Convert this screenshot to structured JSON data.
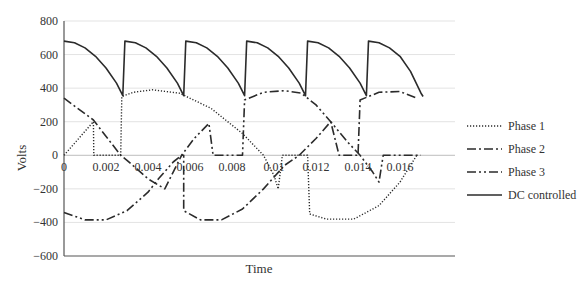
{
  "chart_data": {
    "type": "line",
    "title": "",
    "xlabel": "Time",
    "ylabel": "Volts",
    "xlim": [
      0,
      0.0185
    ],
    "ylim": [
      -600,
      800
    ],
    "x_ticks": [
      "0",
      "0.002",
      "0.004",
      "0.006",
      "0.008",
      "0.01",
      "0.012",
      "0.014",
      "0.016"
    ],
    "x_tick_values": [
      0,
      0.002,
      0.004,
      0.006,
      0.008,
      0.01,
      0.012,
      0.014,
      0.016
    ],
    "y_ticks": [
      "800",
      "600",
      "400",
      "200",
      "0",
      "−200",
      "−400",
      "−600"
    ],
    "y_tick_values": [
      800,
      600,
      400,
      200,
      0,
      -200,
      -400,
      -600
    ],
    "grid": true,
    "legend_position": "right",
    "series": [
      {
        "name": "Phase 1",
        "style": "dotted",
        "points": [
          [
            0,
            0
          ],
          [
            0.0014,
            200
          ],
          [
            0.00142,
            0
          ],
          [
            0.0027,
            0
          ],
          [
            0.00275,
            350
          ],
          [
            0.0033,
            375
          ],
          [
            0.0042,
            390
          ],
          [
            0.0055,
            370
          ],
          [
            0.007,
            280
          ],
          [
            0.0085,
            130
          ],
          [
            0.0095,
            0
          ],
          [
            0.01,
            -120
          ],
          [
            0.0102,
            -200
          ],
          [
            0.0104,
            0
          ],
          [
            0.0116,
            0
          ],
          [
            0.0117,
            -350
          ],
          [
            0.0125,
            -380
          ],
          [
            0.0138,
            -380
          ],
          [
            0.015,
            -300
          ],
          [
            0.016,
            -160
          ],
          [
            0.0168,
            0
          ]
        ]
      },
      {
        "name": "Phase 2",
        "style": "dash-dot",
        "points": [
          [
            0,
            340
          ],
          [
            0.0014,
            210
          ],
          [
            0.0027,
            0
          ],
          [
            0.003,
            -30
          ],
          [
            0.004,
            -140
          ],
          [
            0.0048,
            -200
          ],
          [
            0.0052,
            -100
          ],
          [
            0.0056,
            0
          ],
          [
            0.0057,
            0
          ],
          [
            0.0057,
            -330
          ],
          [
            0.0065,
            -385
          ],
          [
            0.0075,
            -385
          ],
          [
            0.0085,
            -320
          ],
          [
            0.0095,
            -200
          ],
          [
            0.0105,
            -60
          ],
          [
            0.0112,
            0
          ],
          [
            0.012,
            100
          ],
          [
            0.0127,
            200
          ],
          [
            0.0131,
            0
          ],
          [
            0.0138,
            0
          ],
          [
            0.014,
            0
          ],
          [
            0.0141,
            330
          ],
          [
            0.015,
            375
          ],
          [
            0.016,
            380
          ],
          [
            0.0168,
            340
          ]
        ]
      },
      {
        "name": "Phase 3",
        "style": "dash-dot-dot",
        "points": [
          [
            0,
            -340
          ],
          [
            0.001,
            -385
          ],
          [
            0.002,
            -385
          ],
          [
            0.003,
            -330
          ],
          [
            0.004,
            -220
          ],
          [
            0.0045,
            -140
          ],
          [
            0.0052,
            -40
          ],
          [
            0.0056,
            0
          ],
          [
            0.0062,
            100
          ],
          [
            0.0069,
            190
          ],
          [
            0.0071,
            0
          ],
          [
            0.0083,
            0
          ],
          [
            0.0085,
            0
          ],
          [
            0.0086,
            330
          ],
          [
            0.0095,
            375
          ],
          [
            0.0105,
            385
          ],
          [
            0.0113,
            370
          ],
          [
            0.012,
            300
          ],
          [
            0.0127,
            200
          ],
          [
            0.0135,
            80
          ],
          [
            0.0141,
            0
          ],
          [
            0.0147,
            -100
          ],
          [
            0.015,
            -160
          ],
          [
            0.0152,
            0
          ],
          [
            0.0163,
            0
          ],
          [
            0.017,
            0
          ]
        ]
      },
      {
        "name": "DC controlled",
        "style": "solid",
        "points": [
          [
            0,
            680
          ],
          [
            0.0005,
            670
          ],
          [
            0.001,
            640
          ],
          [
            0.0015,
            590
          ],
          [
            0.002,
            520
          ],
          [
            0.0025,
            430
          ],
          [
            0.0028,
            355
          ],
          [
            0.0029,
            680
          ],
          [
            0.0034,
            670
          ],
          [
            0.0039,
            640
          ],
          [
            0.0044,
            590
          ],
          [
            0.0049,
            520
          ],
          [
            0.0054,
            430
          ],
          [
            0.0057,
            355
          ],
          [
            0.0058,
            680
          ],
          [
            0.0063,
            670
          ],
          [
            0.0068,
            640
          ],
          [
            0.0073,
            590
          ],
          [
            0.0078,
            520
          ],
          [
            0.0083,
            430
          ],
          [
            0.0086,
            355
          ],
          [
            0.0087,
            680
          ],
          [
            0.0092,
            670
          ],
          [
            0.0097,
            640
          ],
          [
            0.0102,
            590
          ],
          [
            0.0107,
            520
          ],
          [
            0.0112,
            430
          ],
          [
            0.0115,
            355
          ],
          [
            0.0116,
            680
          ],
          [
            0.0121,
            670
          ],
          [
            0.0126,
            640
          ],
          [
            0.0131,
            590
          ],
          [
            0.0136,
            520
          ],
          [
            0.0141,
            430
          ],
          [
            0.0144,
            355
          ],
          [
            0.0145,
            680
          ],
          [
            0.015,
            670
          ],
          [
            0.0155,
            640
          ],
          [
            0.016,
            590
          ],
          [
            0.0165,
            500
          ],
          [
            0.017,
            370
          ],
          [
            0.0171,
            350
          ]
        ]
      }
    ]
  },
  "legend": {
    "items": [
      {
        "label": "Phase 1",
        "style": "dotted"
      },
      {
        "label": "Phase 2",
        "style": "dash-dot"
      },
      {
        "label": "Phase 3",
        "style": "dash-dot-dot"
      },
      {
        "label": "DC controlled",
        "style": "solid"
      }
    ]
  },
  "colors": {
    "line": "#2b2b2b",
    "grid": "#e3e3e3",
    "axis": "#555555",
    "text": "#333333"
  }
}
